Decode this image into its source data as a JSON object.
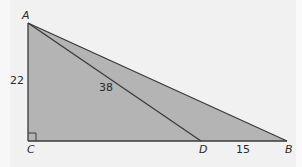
{
  "diagram": {
    "type": "geometry-right-triangle",
    "colors": {
      "background": "#f1f1f1",
      "fill": "#b4b4b4",
      "stroke": "#3a3a3a",
      "text": "#2a2a2a"
    },
    "vertices": {
      "A": {
        "label": "A",
        "x": 28,
        "y": 23
      },
      "C": {
        "label": "C",
        "x": 28,
        "y": 141
      },
      "D": {
        "label": "D",
        "x": 201,
        "y": 141
      },
      "B": {
        "label": "B",
        "x": 287,
        "y": 141
      }
    },
    "measurements": {
      "AC": {
        "label": "22"
      },
      "AD": {
        "label": "38"
      },
      "DB": {
        "label": "15"
      }
    },
    "right_angle_at": "C"
  }
}
